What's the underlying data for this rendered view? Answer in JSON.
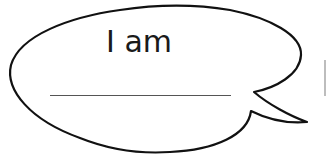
{
  "speech_bubble": {
    "prompt": "I am",
    "answer_value": "",
    "stroke_color": "#111111",
    "fill_color": "#ffffff",
    "line_color": "#555555"
  }
}
